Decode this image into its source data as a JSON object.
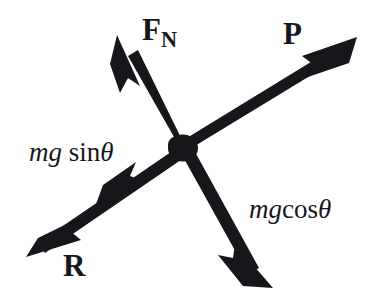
{
  "diagram": {
    "ink_color": "#17161a",
    "background_color": "#ffffff",
    "origin": {
      "x": 183,
      "y": 148
    },
    "labels": {
      "normal_force": "F",
      "normal_force_subscript": "N",
      "applied_force": "P",
      "weight_component_parallel_var1": "mg",
      "weight_component_parallel_fn": "sin",
      "weight_component_parallel_theta": "θ",
      "weight_component_perp_var1": "mg",
      "weight_component_perp_fn": "cos",
      "weight_component_perp_theta": "θ",
      "reaction_force": "R"
    },
    "vectors": [
      {
        "name": "normal-force",
        "label": "F_N",
        "from": {
          "x": 183,
          "y": 148
        },
        "to": {
          "x": 117,
          "y": 35
        },
        "direction": "up-left",
        "arrowheads": 1
      },
      {
        "name": "applied-force",
        "label": "P",
        "from": {
          "x": 183,
          "y": 148
        },
        "to": {
          "x": 355,
          "y": 38
        },
        "direction": "up-right",
        "arrowheads": 1
      },
      {
        "name": "reaction-force",
        "label": "R",
        "from": {
          "x": 183,
          "y": 148
        },
        "to": {
          "x": 27,
          "y": 256
        },
        "direction": "down-left",
        "arrowheads": 2,
        "midpoint_arrowhead_label": "mg sinθ",
        "midpoint": {
          "x": 112,
          "y": 196
        }
      },
      {
        "name": "weight-component-perpendicular",
        "label": "mgcosθ",
        "from": {
          "x": 183,
          "y": 148
        },
        "to": {
          "x": 272,
          "y": 287
        },
        "direction": "down-right",
        "arrowheads": 1
      }
    ]
  }
}
